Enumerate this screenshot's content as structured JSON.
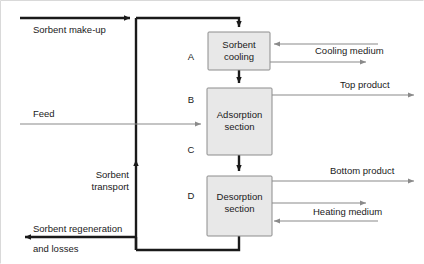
{
  "diagram": {
    "colors": {
      "box_fill": "#e8e8e8",
      "box_stroke": "#8c8c8c",
      "thick_stream": "#1a1a1a",
      "thin_stream": "#8a8a8a",
      "text": "#1a1a1a"
    },
    "units": [
      {
        "id": "A",
        "letter": "A",
        "line1": "Sorbent",
        "line2": "cooling"
      },
      {
        "id": "B",
        "letter": "B",
        "line1": "Adsorption",
        "line2": "section"
      },
      {
        "id": "C",
        "letter": "C",
        "line1": "",
        "line2": ""
      },
      {
        "id": "D",
        "letter": "D",
        "line1": "Desorption",
        "line2": "section"
      }
    ],
    "streams": [
      {
        "id": "sorbent-make-up",
        "label": "Sorbent make-up",
        "kind": "thick",
        "direction": "right"
      },
      {
        "id": "feed",
        "label": "Feed",
        "kind": "thin",
        "direction": "right"
      },
      {
        "id": "sorbent-transport",
        "label_line1": "Sorbent",
        "label_line2": "transport",
        "kind": "thick",
        "direction": "up"
      },
      {
        "id": "sorbent-regeneration",
        "label_line1": "Sorbent regeneration",
        "label_line2": "and losses",
        "kind": "thick",
        "direction": "left"
      },
      {
        "id": "cooling-medium",
        "label": "Cooling medium",
        "kind": "thin",
        "direction": "in-out"
      },
      {
        "id": "top-product",
        "label": "Top product",
        "kind": "thin",
        "direction": "right"
      },
      {
        "id": "bottom-product",
        "label": "Bottom product",
        "kind": "thin",
        "direction": "right"
      },
      {
        "id": "heating-medium",
        "label": "Heating medium",
        "kind": "thin",
        "direction": "in-out"
      }
    ],
    "section_letters": [
      "A",
      "B",
      "C",
      "D"
    ]
  }
}
